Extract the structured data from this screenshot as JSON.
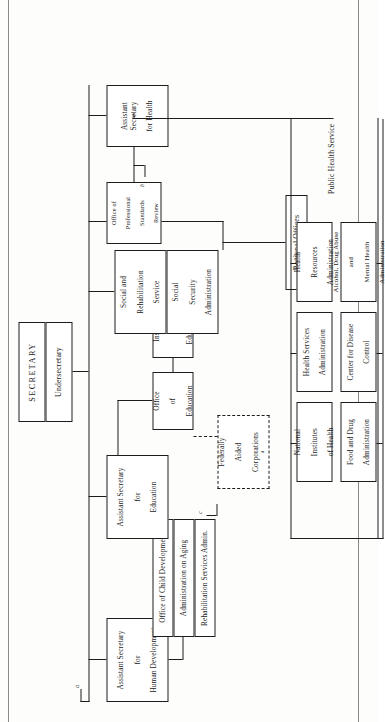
{
  "document": {
    "title": "Department of Health, Education, and Welfare organization chart",
    "orientation": "rotated-90-ccw",
    "rule_color": "#8a8a8a",
    "line_color": "#1d1d1d"
  },
  "head": {
    "secretary": "SECRETARY",
    "undersecretary": "Undersecretary"
  },
  "assistant_secretaries": [
    {
      "id": "asec-human-development",
      "line1": "Assistant Secretary",
      "line2": "for",
      "line3": "Human Development",
      "footnote": "a"
    },
    {
      "id": "asec-education",
      "line1": "Assistant Secretary",
      "line2": "for",
      "line3": "Education",
      "footnote": ""
    },
    {
      "id": "asec-health",
      "line1": "Assistant Secretary",
      "line2": "for Health",
      "line3": "",
      "footnote": ""
    }
  ],
  "human_development_units": [
    {
      "id": "office-child-development",
      "label": "Office of Child Development"
    },
    {
      "id": "administration-on-aging",
      "label": "Administration on Aging"
    },
    {
      "id": "rehabilitation-services-admin",
      "label": "Rehabilitation Services Admin."
    }
  ],
  "education_units": [
    {
      "id": "office-of-education",
      "line1": "Office",
      "line2": "of",
      "line3": "Education"
    },
    {
      "id": "institute-of-education",
      "line1": "Institute",
      "line2": "of",
      "line3": "Education"
    }
  ],
  "advisory": {
    "id": "federally-aided-corporations",
    "line1": "Federally",
    "line2": "Aided",
    "line3": "Corporations",
    "superscript": "d",
    "style": "dashed"
  },
  "secretary_direct_units": [
    {
      "id": "social-rehabilitation-service",
      "line1": "Social and",
      "line2": "Rehabilitation",
      "line3": "Service"
    },
    {
      "id": "social-security-administration",
      "line1": "Social",
      "line2": "Security",
      "line3": "Administration"
    },
    {
      "id": "regional-offices",
      "line1": "Regional Offices",
      "line2": "",
      "line3": ""
    }
  ],
  "health_staff_office": {
    "id": "office-professional-standards-review",
    "line1": "Office of",
    "line2": "Professional",
    "line3": "Standards",
    "line4": "Review",
    "footnote": "b"
  },
  "public_health_service": {
    "group_label": "Public Health Service",
    "agencies": [
      {
        "id": "health-resources-administration",
        "line1": "Health",
        "line2": "Resources",
        "line3": "Administration"
      },
      {
        "id": "health-services-administration",
        "line1": "Health Services",
        "line2": "Administration",
        "line3": ""
      },
      {
        "id": "national-institutes-of-health",
        "line1": "National",
        "line2": "Institutes",
        "line3": "of Health"
      },
      {
        "id": "alcohol-drug-abuse-mental-health-administration",
        "line1": "Alcohol, Drug Abuse",
        "line2": "and",
        "line3": "Mental Health",
        "line4": "Administration"
      },
      {
        "id": "center-for-disease-control",
        "line1": "Center for Disease",
        "line2": "Control",
        "line3": ""
      },
      {
        "id": "food-and-drug-administration",
        "line1": "Food and Drug",
        "line2": "Administration",
        "line3": ""
      }
    ]
  },
  "footnote_markers": {
    "a": "a",
    "b": "b",
    "c": "c",
    "d": "d"
  }
}
